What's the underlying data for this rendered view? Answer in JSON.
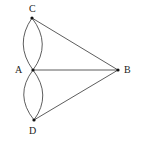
{
  "diagram": {
    "type": "graph",
    "nodes": [
      {
        "id": "C",
        "label": "C",
        "x": 32,
        "y": 18,
        "label_x": 29,
        "label_y": 12
      },
      {
        "id": "A",
        "label": "A",
        "x": 33,
        "y": 70,
        "label_x": 15,
        "label_y": 73
      },
      {
        "id": "B",
        "label": "B",
        "x": 118,
        "y": 70,
        "label_x": 124,
        "label_y": 73
      },
      {
        "id": "D",
        "label": "D",
        "x": 34,
        "y": 120,
        "label_x": 29,
        "label_y": 134
      }
    ],
    "edges": [
      {
        "from": "C",
        "to": "A",
        "kind": "curve-left"
      },
      {
        "from": "C",
        "to": "A",
        "kind": "curve-right"
      },
      {
        "from": "A",
        "to": "D",
        "kind": "curve-left"
      },
      {
        "from": "A",
        "to": "D",
        "kind": "curve-right"
      },
      {
        "from": "C",
        "to": "B",
        "kind": "straight"
      },
      {
        "from": "A",
        "to": "B",
        "kind": "straight"
      },
      {
        "from": "D",
        "to": "B",
        "kind": "straight"
      }
    ]
  }
}
